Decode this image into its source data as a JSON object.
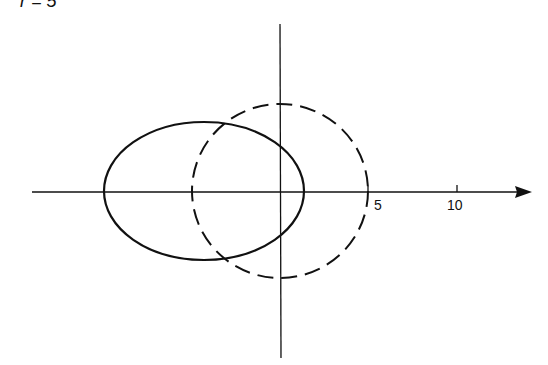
{
  "title": "r = 5",
  "axes": {
    "x_tick_labels": [
      "5",
      "10"
    ],
    "x_arrow": true
  },
  "curves": [
    {
      "name": "solid-ellipse",
      "style": "solid",
      "color": "#111111"
    },
    {
      "name": "dashed-circle",
      "style": "dashed",
      "color": "#111111"
    }
  ]
}
